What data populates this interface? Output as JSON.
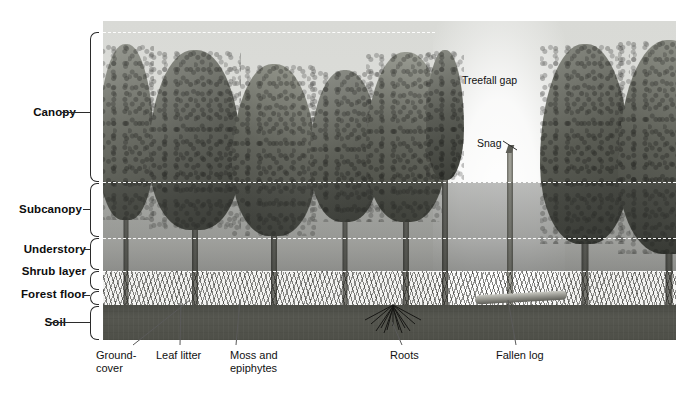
{
  "layers": [
    {
      "id": "canopy",
      "label": "Canopy",
      "top": 32,
      "bottom": 182
    },
    {
      "id": "subcanopy",
      "label": "Subcanopy",
      "top": 182,
      "bottom": 238
    },
    {
      "id": "understory",
      "label": "Understory",
      "top": 238,
      "bottom": 271
    },
    {
      "id": "shrub-layer",
      "label": "Shrub layer",
      "top": 271,
      "bottom": 291
    },
    {
      "id": "forest-floor",
      "label": "Forest floor",
      "top": 291,
      "bottom": 305
    },
    {
      "id": "soil",
      "label": "Soil",
      "top": 305,
      "bottom": 340
    }
  ],
  "dashed_rules": [
    {
      "id": "canopy-top",
      "y": 32
    },
    {
      "id": "subcanopy-top",
      "y": 182
    },
    {
      "id": "understory-top",
      "y": 238
    },
    {
      "id": "shrub-top",
      "y": 271
    }
  ],
  "scene_annotations": [
    {
      "id": "treefall-gap",
      "label": "Treefall gap",
      "x": 462,
      "y": 80,
      "has_leader": false
    },
    {
      "id": "snag",
      "label": "Snag",
      "x": 477,
      "y": 143,
      "has_leader": true
    }
  ],
  "bottom_callouts": [
    {
      "id": "ground-cover",
      "label": "Ground-\ncover",
      "text_x": 96,
      "text_y": 350,
      "tip_x": 190,
      "tip_y": 300
    },
    {
      "id": "leaf-litter",
      "label": "Leaf litter",
      "text_x": 156,
      "text_y": 350,
      "tip_x": 181,
      "tip_y": 300
    },
    {
      "id": "moss-and-epiphytes",
      "label": "Moss and\nepiphytes",
      "text_x": 230,
      "text_y": 350,
      "tip_x": 240,
      "tip_y": 300
    },
    {
      "id": "roots",
      "label": "Roots",
      "text_x": 390,
      "text_y": 350,
      "tip_x": 392,
      "tip_y": 322
    },
    {
      "id": "fallen-log",
      "label": "Fallen log",
      "text_x": 496,
      "text_y": 350,
      "tip_x": 508,
      "tip_y": 300
    }
  ],
  "colors": {
    "label_text": "#0d0d0d",
    "bracket": "#2b2b2b",
    "dashed_rule": "#ffffff",
    "soil": "#4e4f48",
    "sky": "#dcddd9",
    "callout_text": "#111111",
    "leader_line": "#555555"
  },
  "panel": {
    "left": 103,
    "top": 21,
    "width": 573,
    "height": 319
  }
}
